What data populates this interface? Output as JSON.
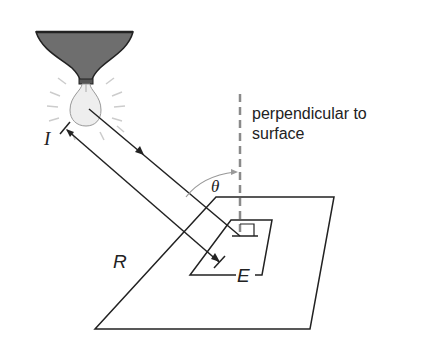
{
  "diagram": {
    "labels": {
      "perpendicular_line1": "perpendicular to",
      "perpendicular_line2": "surface",
      "intensity": "I",
      "distance": "R",
      "angle": "θ",
      "illuminance": "E"
    },
    "elements": [
      "lamp-shade",
      "light-bulb",
      "light-rays",
      "incident-ray",
      "distance-dimension",
      "perpendicular-dashed-line",
      "angle-arc",
      "surface-plane",
      "illuminated-patch"
    ],
    "colors": {
      "line": "#222222",
      "shade_fill": "#6e6e6e",
      "bulb_fill": "#eeeeee",
      "dashed": "#8a8a8a",
      "glow": "#cccccc"
    }
  }
}
